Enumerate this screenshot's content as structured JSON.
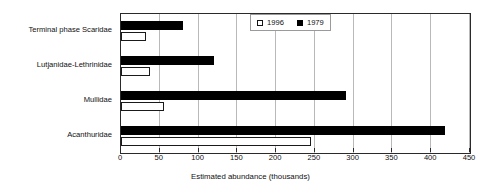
{
  "chart_data": {
    "type": "bar",
    "orientation": "horizontal",
    "title": "",
    "xlabel": "Estimated abundance (thousands)",
    "ylabel": "",
    "categories": [
      "Terminal phase Scaridae",
      "Lutjanidae-Lethrinidae",
      "Mullidae",
      "Acanthuridae"
    ],
    "series": [
      {
        "name": "1996",
        "style": "open",
        "values": [
          32,
          38,
          55,
          245
        ]
      },
      {
        "name": "1979",
        "style": "filled",
        "values": [
          80,
          120,
          290,
          418
        ]
      }
    ],
    "xlim": [
      0,
      450
    ],
    "xticks": [
      0,
      50,
      100,
      150,
      200,
      250,
      300,
      350,
      400,
      450
    ],
    "xtick_labels": [
      "0",
      "50",
      "100",
      "150",
      "200",
      "250",
      "300",
      "350",
      "400",
      "450"
    ],
    "grid": "vertical",
    "legend_position": "top-right-inside",
    "colors": {
      "filled": "#000000",
      "open": "#ffffff",
      "outline": "#1a1a1a",
      "gridline": "#b9b9b9",
      "axis": "#2a2a2a",
      "text": "#101010",
      "background": "#ffffff"
    }
  },
  "legend": {
    "entries": [
      {
        "label": "1996",
        "swatch": "open-square-icon"
      },
      {
        "label": "1979",
        "swatch": "filled-square-icon"
      }
    ]
  }
}
